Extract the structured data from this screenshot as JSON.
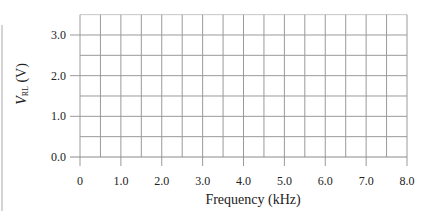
{
  "chart_data": {
    "type": "line",
    "title": "",
    "xlabel": "Frequency (kHz)",
    "ylabel": {
      "symbol": "V",
      "subscript": "RL",
      "unit": "(V)"
    },
    "x_ticks": [
      "0",
      "1.0",
      "2.0",
      "3.0",
      "4.0",
      "5.0",
      "6.0",
      "7.0",
      "8.0"
    ],
    "x_tick_values": [
      0,
      1,
      2,
      3,
      4,
      5,
      6,
      7,
      8
    ],
    "y_ticks": [
      "0.0",
      "1.0",
      "2.0",
      "3.0"
    ],
    "y_tick_values": [
      0,
      1,
      2,
      3
    ],
    "xlim": [
      0,
      8
    ],
    "ylim": [
      0,
      3.5
    ],
    "grid": true,
    "grid_x_step": 0.5,
    "grid_y_step": 0.5,
    "series": [],
    "legend": null,
    "note": "Blank graph grid with no plotted data"
  },
  "colors": {
    "grid": "#9a9a9a",
    "axis": "#8a8a8a",
    "text": "#222222"
  }
}
